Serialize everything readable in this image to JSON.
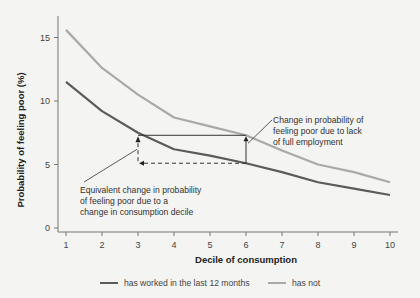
{
  "chart_data": {
    "type": "line",
    "title": "",
    "xlabel": "Decile of consumption",
    "ylabel": "Probability of feeling poor (%)",
    "x": [
      1,
      2,
      3,
      4,
      5,
      6,
      7,
      8,
      9,
      10
    ],
    "xticks": [
      "1",
      "2",
      "3",
      "4",
      "5",
      "6",
      "7",
      "8",
      "9",
      "10"
    ],
    "yticks": [
      "0",
      "5",
      "10",
      "15"
    ],
    "ylim": [
      0,
      16
    ],
    "xlim": [
      1,
      10
    ],
    "grid": false,
    "legend_position": "bottom",
    "series": [
      {
        "name": "has worked in the last 12 months",
        "color": "#5b5b5b",
        "values": [
          11.5,
          9.2,
          7.5,
          6.2,
          5.7,
          5.1,
          4.4,
          3.6,
          3.1,
          2.6
        ]
      },
      {
        "name": "has not",
        "color": "#a9a9a9",
        "values": [
          15.6,
          12.6,
          10.5,
          8.7,
          8.0,
          7.3,
          6.1,
          5.0,
          4.4,
          3.6
        ]
      }
    ],
    "annotations": [
      {
        "id": "employment",
        "lines": [
          "Change in probability of",
          "feeling poor due to lack",
          "of full employment"
        ]
      },
      {
        "id": "decile",
        "lines": [
          "Equivalent change in probability",
          "of feeling poor due to a",
          "change in consumption decile"
        ]
      }
    ]
  },
  "legend": {
    "items": [
      {
        "label": "has worked in the last 12 months",
        "color": "#5b5b5b"
      },
      {
        "label": "has not",
        "color": "#a9a9a9"
      }
    ]
  }
}
